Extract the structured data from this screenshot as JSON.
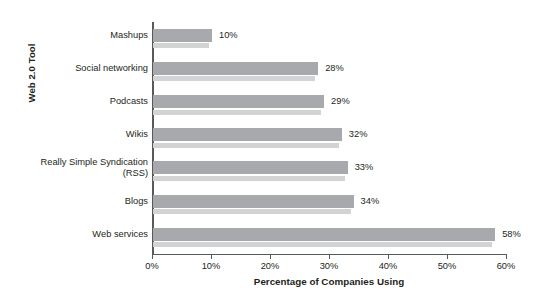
{
  "chart_data": {
    "type": "bar",
    "orientation": "horizontal",
    "title": "",
    "xlabel": "Percentage of Companies Using",
    "ylabel": "Web 2.0 Tool",
    "categories": [
      "Mashups",
      "Social networking",
      "Podcasts",
      "Wikis",
      "Really Simple Syndication\n(RSS)",
      "Blogs",
      "Web services"
    ],
    "values": [
      10,
      28,
      29,
      32,
      33,
      34,
      58
    ],
    "data_labels": [
      "10%",
      "28%",
      "29%",
      "32%",
      "33%",
      "34%",
      "58%"
    ],
    "xlim": [
      0,
      60
    ],
    "xticks": [
      0,
      10,
      20,
      30,
      40,
      50,
      60
    ],
    "xtick_labels": [
      "0%",
      "10%",
      "20%",
      "30%",
      "40%",
      "50%",
      "60%"
    ],
    "grid": false,
    "legend": false,
    "bar_color": "#a7a9ac",
    "bar_shadow_color": "#d1d3d4",
    "axis_color": "#58595b",
    "text_color": "#231f20",
    "background": "#ffffff"
  }
}
